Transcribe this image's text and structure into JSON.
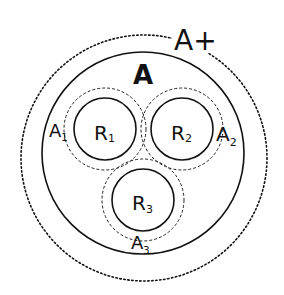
{
  "diagram": {
    "type": "nested-circles",
    "regions": {
      "outer_dotted": {
        "label": "A+",
        "sub": ""
      },
      "main_solid": {
        "label": "A",
        "sub": ""
      },
      "r1": {
        "label": "R",
        "sub": "1"
      },
      "r2": {
        "label": "R",
        "sub": "2"
      },
      "r3": {
        "label": "R",
        "sub": "3"
      },
      "a1": {
        "label": "A",
        "sub": "1"
      },
      "a2": {
        "label": "A",
        "sub": "2"
      },
      "a3": {
        "label": "A",
        "sub": "3"
      }
    },
    "line_color": "#111111",
    "background": "#ffffff"
  }
}
